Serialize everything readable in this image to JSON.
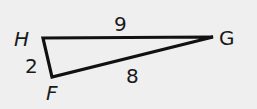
{
  "diagram": {
    "type": "triangle",
    "vertices": {
      "H": {
        "label": "H"
      },
      "G": {
        "label": "G"
      },
      "F": {
        "label": "F"
      }
    },
    "sides": {
      "HG": {
        "label": "9"
      },
      "HF": {
        "label": "2"
      },
      "FG": {
        "label": "8"
      }
    },
    "background_color": "#efefef",
    "stroke_color": "#111111"
  }
}
